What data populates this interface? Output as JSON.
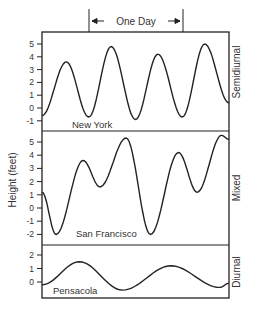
{
  "chart_data": {
    "type": "line",
    "title": "",
    "annotation": "One Day",
    "ylabel": "Height (feet)",
    "xlabel": "",
    "grid": false,
    "panels": [
      {
        "name": "Semidiurnal",
        "location": "New York",
        "ylim": [
          -1.3,
          5.9
        ],
        "yticks": [
          5,
          4,
          3,
          2,
          1,
          0,
          -1
        ],
        "x": [
          0,
          0.13,
          0.25,
          0.37,
          0.5,
          0.62,
          0.75,
          0.87,
          1.0
        ],
        "values": [
          -0.6,
          3.6,
          -0.7,
          4.8,
          -0.9,
          4.2,
          -0.7,
          5.0,
          0.4
        ]
      },
      {
        "name": "Mixed",
        "location": "San Francisco",
        "ylim": [
          -2.2,
          5.9
        ],
        "yticks": [
          5,
          4,
          3,
          2,
          1,
          0,
          -1,
          -2
        ],
        "x": [
          0,
          0.075,
          0.22,
          0.31,
          0.45,
          0.58,
          0.73,
          0.83,
          0.96,
          1.0
        ],
        "values": [
          1.2,
          -2.0,
          3.6,
          1.6,
          5.3,
          -2.0,
          4.2,
          1.2,
          5.5,
          5.2
        ]
      },
      {
        "name": "Diurnal",
        "location": "Pensacola",
        "ylim": [
          -0.9,
          2.8
        ],
        "yticks": [
          2,
          1,
          0
        ],
        "x": [
          0,
          0.2,
          0.43,
          0.69,
          0.95,
          1.0
        ],
        "values": [
          -0.2,
          1.5,
          -0.6,
          1.2,
          -0.4,
          -0.1
        ]
      }
    ]
  }
}
